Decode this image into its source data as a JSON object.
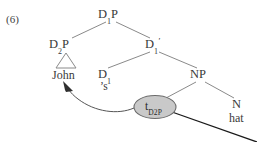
{
  "figure": {
    "example_number": "(6)",
    "type": "syntax-tree"
  },
  "tree": {
    "nodes": [
      {
        "id": "d1p",
        "label": "D",
        "subscript": "1",
        "suffix": "P",
        "x": 110,
        "y": 14
      },
      {
        "id": "d2p",
        "label": "D",
        "subscript": "2",
        "suffix": "P",
        "x": 62,
        "y": 44
      },
      {
        "id": "d1bar",
        "label": "D",
        "subscript": "1",
        "suffix": "",
        "prime": "′",
        "x": 154,
        "y": 44
      },
      {
        "id": "d1",
        "label": "D",
        "subscript": "1",
        "suffix": "",
        "x": 104,
        "y": 74
      },
      {
        "id": "np",
        "label": "NP",
        "subscript": "",
        "suffix": "",
        "x": 200,
        "y": 74
      },
      {
        "id": "n",
        "label": "N",
        "subscript": "",
        "suffix": "",
        "x": 236,
        "y": 104
      }
    ],
    "terminals": [
      {
        "id": "john",
        "text": "John",
        "x": 66,
        "y": 75
      },
      {
        "id": "poss",
        "text": "’s",
        "x": 106,
        "y": 87
      },
      {
        "id": "hat",
        "text": "hat",
        "x": 239,
        "y": 118
      }
    ],
    "trace": {
      "id": "trace-d2p",
      "label": "t",
      "subscript": "D2P",
      "x": 155,
      "y": 107,
      "fill": "#c9c9c9",
      "stroke": "#6b6b6b"
    },
    "triangle": {
      "id": "triangle-john",
      "apex_x": 66,
      "apex_y": 53,
      "left_x": 56,
      "right_x": 76,
      "base_y": 68
    }
  },
  "colors": {
    "background": "#ffffff",
    "ink": "#3a3a3a",
    "branch": "#8a8a8a",
    "movement_arrow": "#555555",
    "trace_fill": "#c9c9c9",
    "trace_stroke": "#6b6b6b",
    "dark_line": "#1a1a1a"
  },
  "annotations": {
    "movement_arrow_name": "movement-arrow-d2p-to-spec",
    "movement_arrow_description": "curved arrow from trace to John indicating DP raising"
  }
}
